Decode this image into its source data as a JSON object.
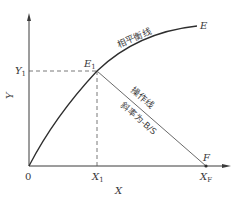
{
  "diagram": {
    "type": "phase-equilibrium-operating-line",
    "axes": {
      "x_label": "X",
      "y_label": "Y",
      "origin_label": "0"
    },
    "points": {
      "E1": {
        "label": "E",
        "subscript": "1"
      },
      "E": {
        "label": "E"
      },
      "F": {
        "label": "F"
      }
    },
    "ticks": {
      "x1": {
        "label": "X",
        "subscript": "1"
      },
      "xf": {
        "label": "X",
        "subscript": "F"
      },
      "y1": {
        "label": "Y",
        "subscript": "1"
      }
    },
    "curves": {
      "equilibrium_line_label": "相平衡线",
      "operating_line_label": "操作线",
      "operating_line_slope_label": "斜率为-B/S"
    },
    "colors": {
      "line": "#3a3a3a",
      "operating_line": "#6a6a6a",
      "dashed": "#555555",
      "background": "#ffffff"
    }
  }
}
